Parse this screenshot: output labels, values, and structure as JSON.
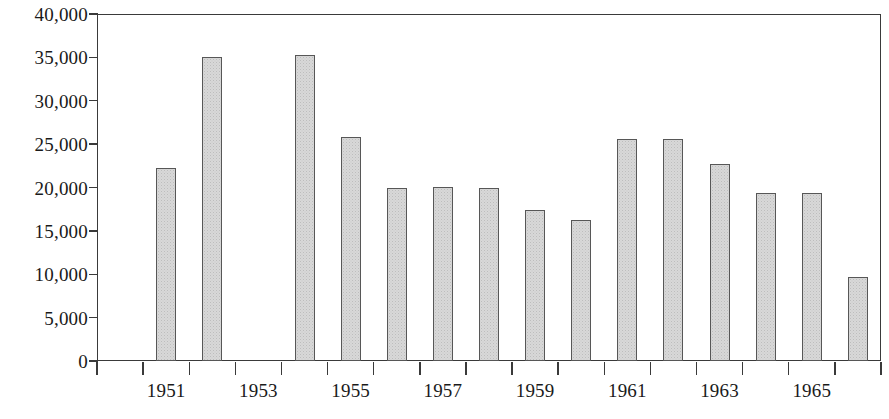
{
  "chart_data": {
    "type": "bar",
    "title": "",
    "subtitle": "",
    "xlabel": "",
    "ylabel": "",
    "categories": [
      "1950",
      "1951",
      "1952",
      "1953",
      "1954",
      "1955",
      "1956",
      "1957",
      "1958",
      "1959",
      "1960",
      "1961",
      "1962",
      "1963",
      "1964",
      "1965",
      "1966"
    ],
    "values": [
      null,
      22200,
      35000,
      null,
      35300,
      25800,
      20000,
      20100,
      19900,
      17400,
      16200,
      25600,
      25600,
      22700,
      19400,
      19400,
      9700
    ],
    "ylim": [
      0,
      40000
    ],
    "y_ticks": [
      0,
      5000,
      10000,
      15000,
      20000,
      25000,
      30000,
      35000,
      40000
    ],
    "y_tick_labels": [
      "0",
      "5,000",
      "10,000",
      "15,000",
      "20,000",
      "25,000",
      "30,000",
      "35,000",
      "40,000"
    ],
    "x_tick_labels": [
      "1951",
      "1953",
      "1955",
      "1957",
      "1959",
      "1961",
      "1963",
      "1965"
    ],
    "x_labelled_categories": [
      "1951",
      "1953",
      "1955",
      "1957",
      "1959",
      "1961",
      "1963",
      "1965"
    ],
    "grid": false,
    "legend": null,
    "legend_position": "none",
    "bar_fill_color": "#d8d8d8",
    "bar_border_color": "#575757",
    "axis_color": "#3a3a3a",
    "text_color": "#1a1a1a",
    "background_color": "#ffffff"
  }
}
